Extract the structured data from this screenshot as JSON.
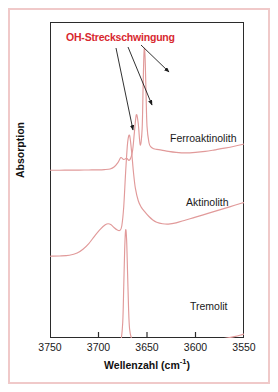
{
  "figure": {
    "annotation": "OH-Streckschwingung",
    "annotation_color": "#d8282f",
    "curve_color": "#e19a9a",
    "frame_color": "#2b2b2b",
    "border_color": "#f0c9c9"
  },
  "axes": {
    "x_title_text": "Wellenzahl (cm",
    "x_title_sup": "-1",
    "x_title_close": ")",
    "x_title_full": "Wellenzahl (cm-1)",
    "y_title": "Absorption"
  },
  "labels": {
    "ferroaktinolith": "Ferroaktinolith",
    "aktinolith": "Aktinolith",
    "tremolit": "Tremolit"
  },
  "chart_data": {
    "type": "line",
    "title": "",
    "subtitle": "",
    "xlabel": "Wellenzahl (cm-1)",
    "ylabel": "Absorption",
    "xlim": [
      3750,
      3550
    ],
    "x_reversed": true,
    "xticks": [
      3750,
      3700,
      3650,
      3600,
      3550
    ],
    "xtick_labels": [
      "3750",
      "3700",
      "3650",
      "3600",
      "3550"
    ],
    "ylim": [
      0,
      1
    ],
    "yticks": [],
    "ytick_labels": [],
    "grid": false,
    "legend": "inline-right-of-curve",
    "annotations": [
      {
        "text": "OH-Streckschwingung",
        "color": "#d8282f",
        "x": 3712,
        "arrows": [
          {
            "from_x": 3707,
            "from_y": 0.92,
            "to_x": 3672,
            "to_y": 0.62
          },
          {
            "from_x": 3702,
            "from_y": 0.92,
            "to_x": 3662,
            "to_y": 0.73
          },
          {
            "from_x": 3697,
            "from_y": 0.93,
            "to_x": 3653,
            "to_y": 0.84
          }
        ]
      }
    ],
    "series": [
      {
        "name": "Ferroaktinolith",
        "color": "#e19a9a",
        "offset": "top",
        "peaks": [
          {
            "wavenumber": 3676,
            "relative_height": 0.12
          },
          {
            "wavenumber": 3670,
            "relative_height": 0.1
          },
          {
            "wavenumber": 3662,
            "relative_height": 0.52
          },
          {
            "wavenumber": 3653,
            "relative_height": 1.0
          }
        ],
        "x": [
          3750,
          3740,
          3730,
          3720,
          3710,
          3700,
          3694,
          3688,
          3684,
          3680,
          3677,
          3674,
          3671,
          3668,
          3665,
          3663,
          3661,
          3659,
          3657,
          3655,
          3654,
          3653,
          3652,
          3651,
          3650,
          3648,
          3646,
          3643,
          3640,
          3635,
          3628,
          3620,
          3610,
          3600,
          3590,
          3580,
          3570,
          3560,
          3550
        ],
        "y": [
          0.03,
          0.03,
          0.031,
          0.031,
          0.032,
          0.033,
          0.035,
          0.04,
          0.055,
          0.09,
          0.13,
          0.115,
          0.125,
          0.11,
          0.18,
          0.33,
          0.47,
          0.4,
          0.23,
          0.36,
          0.7,
          0.98,
          0.93,
          0.64,
          0.38,
          0.25,
          0.215,
          0.2,
          0.195,
          0.19,
          0.18,
          0.172,
          0.168,
          0.172,
          0.18,
          0.192,
          0.205,
          0.22,
          0.238
        ]
      },
      {
        "name": "Aktinolith",
        "color": "#e19a9a",
        "offset": "middle",
        "peaks": [
          {
            "wavenumber": 3690,
            "relative_height": 0.28
          },
          {
            "wavenumber": 3668,
            "relative_height": 1.0
          }
        ],
        "x": [
          3750,
          3740,
          3730,
          3722,
          3716,
          3710,
          3704,
          3698,
          3693,
          3690,
          3687,
          3684,
          3681,
          3678,
          3676,
          3674,
          3672,
          3670,
          3668,
          3666,
          3664,
          3662,
          3659,
          3656,
          3652,
          3648,
          3644,
          3640,
          3634,
          3628,
          3620,
          3610,
          3600,
          3588,
          3576,
          3564,
          3552,
          3550
        ],
        "y": [
          0.03,
          0.032,
          0.038,
          0.055,
          0.085,
          0.13,
          0.19,
          0.245,
          0.28,
          0.288,
          0.28,
          0.258,
          0.24,
          0.235,
          0.27,
          0.42,
          0.7,
          0.93,
          0.99,
          0.87,
          0.7,
          0.57,
          0.47,
          0.42,
          0.38,
          0.345,
          0.318,
          0.3,
          0.288,
          0.285,
          0.295,
          0.318,
          0.34,
          0.368,
          0.396,
          0.424,
          0.452,
          0.455
        ]
      },
      {
        "name": "Tremolit",
        "color": "#e19a9a",
        "offset": "bottom",
        "peaks": [
          {
            "wavenumber": 3672,
            "relative_height": 1.0
          }
        ],
        "x": [
          3750,
          3735,
          3720,
          3710,
          3700,
          3692,
          3686,
          3682,
          3679,
          3677,
          3675,
          3674,
          3673,
          3672,
          3671,
          3670,
          3669,
          3668,
          3666,
          3663,
          3660,
          3656,
          3650,
          3642,
          3632,
          3620,
          3606,
          3590,
          3574,
          3560,
          3552,
          3550
        ],
        "y": [
          0.022,
          0.022,
          0.023,
          0.024,
          0.025,
          0.027,
          0.03,
          0.035,
          0.048,
          0.08,
          0.24,
          0.52,
          0.83,
          0.985,
          0.9,
          0.63,
          0.35,
          0.19,
          0.11,
          0.075,
          0.062,
          0.056,
          0.052,
          0.052,
          0.056,
          0.062,
          0.072,
          0.086,
          0.104,
          0.124,
          0.14,
          0.145
        ]
      }
    ]
  }
}
